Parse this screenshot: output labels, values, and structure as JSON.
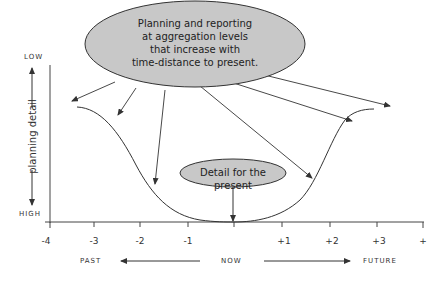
{
  "diagram": {
    "big_bubble": {
      "lines": [
        "Planning and reporting",
        "at aggregation levels",
        "that increase with",
        "time-distance to present."
      ]
    },
    "small_bubble": {
      "text": "Detail for the present"
    },
    "y_axis": {
      "label": "planning detail",
      "top": "LOW",
      "bottom": "HIGH"
    },
    "x_axis": {
      "ticks": [
        "-4",
        "-3",
        "-2",
        "-1",
        "+1",
        "+2",
        "+3",
        "+"
      ],
      "past": "PAST",
      "now": "NOW",
      "future": "FUTURE"
    },
    "colors": {
      "bubble_fill": "#c8c8c8",
      "line": "#333333"
    }
  }
}
